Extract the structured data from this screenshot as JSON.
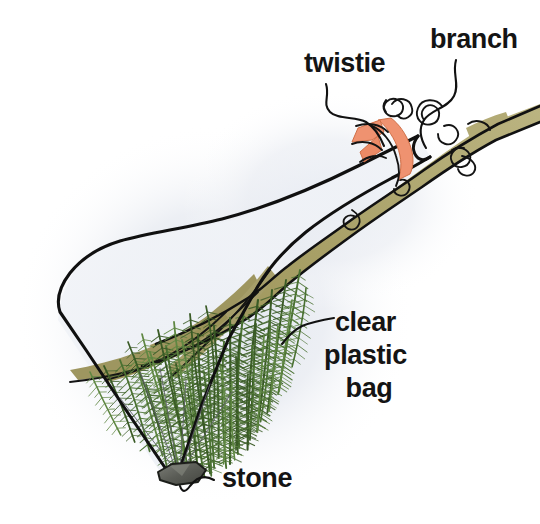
{
  "illustration": {
    "title": "Branch in clear plastic bag",
    "description": "Hand-drawn instructional diagram of a leafy conifer branch inserted into a clear plastic bag, tied at the top with a twistie and weighted at the bottom with a stone.",
    "width": 540,
    "height": 524,
    "background_color": "#ffffff"
  },
  "labels": [
    {
      "id": "twistie",
      "text": "twistie",
      "x": 304,
      "y": 72,
      "anchor": "start"
    },
    {
      "id": "branch",
      "text": "branch",
      "x": 430,
      "y": 48,
      "anchor": "start"
    },
    {
      "id": "clear-plastic-bag",
      "lines": [
        "clear",
        "plastic",
        "bag"
      ],
      "x": 369,
      "y": 331,
      "anchor": "middle",
      "line_height": 33
    },
    {
      "id": "stone",
      "text": "stone",
      "x": 222,
      "y": 487,
      "anchor": "start"
    }
  ],
  "colors": {
    "ink": "#111111",
    "branch_wood": "#a29a63",
    "branch_wood_shadow": "#8d8553",
    "branch_wood_light": "#b5ad77",
    "foliage_green": "#4a7132",
    "foliage_green_dark": "#3a5b26",
    "foliage_green_light": "#5f8742",
    "twistie_orange": "#ef9270",
    "twistie_orange_dark": "#e07a55",
    "stone_gray": "#585a55",
    "stone_gray_light": "#7c7e77",
    "bag_halo": "#e9ecf2",
    "bag_interior": "#f7f8fa",
    "crease_gray": "#5d6068",
    "label_text": "#141414",
    "page_background": "#ffffff"
  },
  "parts": [
    {
      "name": "branch",
      "description": "Tan woody stem running diagonally from lower-left inside the bag up to the upper-right, protruding out of the bag mouth."
    },
    {
      "name": "twistie",
      "description": "Orange tie cinching the bag mouth closed around the branch."
    },
    {
      "name": "clear plastic bag",
      "description": "Transparent bag enclosing the foliage, drawn as a thin black outline with a pale blue-gray tint."
    },
    {
      "name": "stone",
      "description": "Small dark gray weight resting in the bottom point of the bag."
    },
    {
      "name": "foliage",
      "description": "Green needle sprays hanging down from the branch inside the bag."
    }
  ]
}
